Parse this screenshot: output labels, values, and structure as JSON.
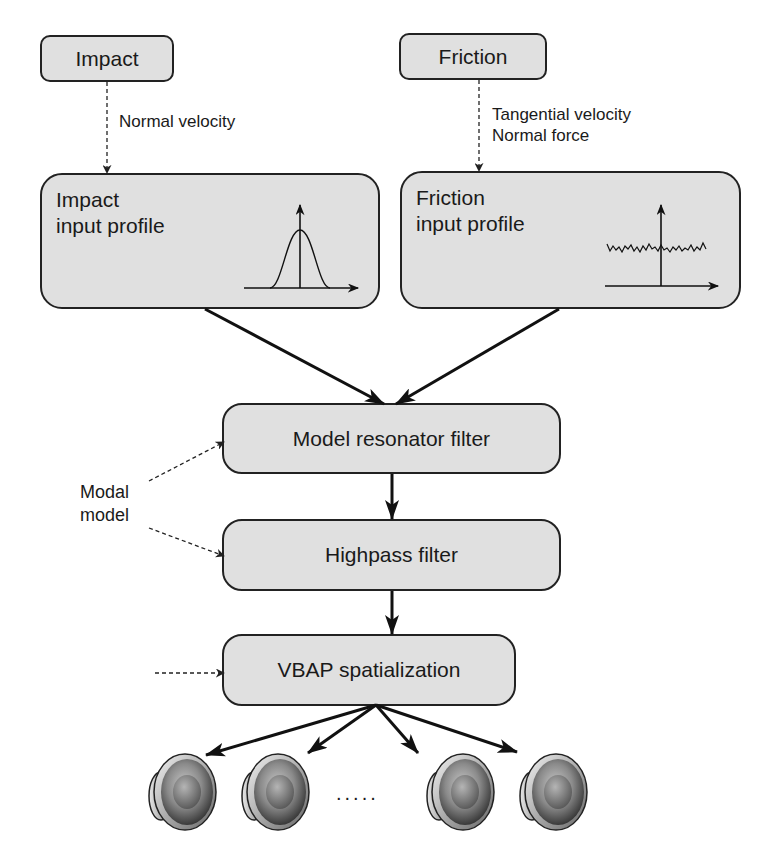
{
  "diagram": {
    "sources": [
      {
        "id": "impact",
        "label": "Impact",
        "edge_label": [
          "Normal velocity"
        ]
      },
      {
        "id": "friction",
        "label": "Friction",
        "edge_label": [
          "Tangential velocity",
          "Normal force"
        ]
      }
    ],
    "profiles": [
      {
        "id": "impact-profile",
        "line1": "Impact",
        "line2": "input profile",
        "plot": "gaussian-pulse"
      },
      {
        "id": "friction-profile",
        "line1": "Friction",
        "line2": "input profile",
        "plot": "noisy-signal"
      }
    ],
    "stages": [
      {
        "id": "modal-resonator",
        "label": "Model resonator filter"
      },
      {
        "id": "highpass",
        "label": "Highpass filter"
      },
      {
        "id": "vbap",
        "label": "VBAP spatialization"
      }
    ],
    "side_inputs": {
      "modal_model": {
        "line1": "Modal",
        "line2": "model"
      }
    },
    "outputs": {
      "speakers_icon": "speaker-icon",
      "visible_speakers": 4,
      "ellipsis": "....."
    },
    "colors": {
      "box_fill": "#e0e0e0",
      "stroke": "#222222",
      "background": "#ffffff"
    }
  }
}
